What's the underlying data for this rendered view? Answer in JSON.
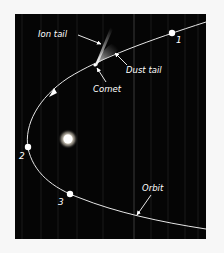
{
  "diagram": {
    "background_color": "#050505",
    "page_color": "#f7f7f7",
    "line_color": "#e6e6e6",
    "labels": {
      "ion_tail": "Ion tail",
      "dust_tail": "Dust tail",
      "comet": "Comet",
      "orbit": "Orbit"
    },
    "positions": [
      {
        "id": "1",
        "label": "1"
      },
      {
        "id": "2",
        "label": "2"
      },
      {
        "id": "3",
        "label": "3"
      }
    ],
    "objects": {
      "sun": "sun",
      "comet_head": "comet-nucleus"
    }
  }
}
